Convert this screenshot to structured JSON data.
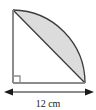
{
  "figure": {
    "shape_name": "quarter-circle-segment",
    "dimension_label": "12 cm",
    "dimension_value": 12,
    "dimension_units": "cm",
    "right_angle_marker": "right-angle",
    "colors": {
      "shaded_fill": "#dcdcdc",
      "outline": "#3c3c3c",
      "leg_line": "#8c8c8c",
      "dimension_line": "#1a1a1a",
      "background": "#ffffff",
      "text": "#1a1a1a"
    },
    "geometry": {
      "corner_x": 13,
      "corner_y": 83,
      "apex_x": 13,
      "apex_y": 10,
      "end_x": 85,
      "end_y": 83,
      "radius": 73,
      "arc_sweep_degrees": 90,
      "segment_description": "region between chord from top apex to right end and the quarter arc"
    },
    "dimension_line": {
      "y": 92,
      "x_start": 8,
      "x_end": 90,
      "arrow_left": "arrow-left",
      "arrow_right": "arrow-right"
    }
  }
}
